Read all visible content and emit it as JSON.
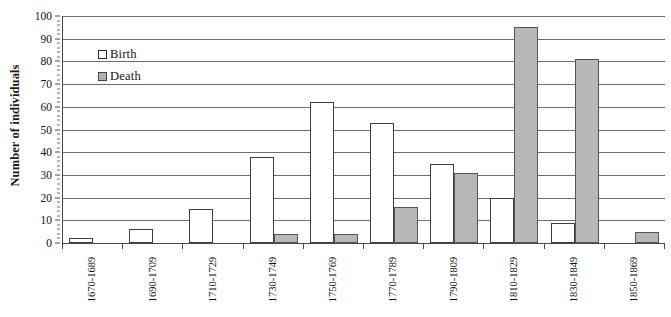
{
  "chart_data": {
    "type": "bar",
    "title": "",
    "xlabel": "",
    "ylabel": "Number of individuals",
    "ylim": [
      0,
      100
    ],
    "ytick_step": 10,
    "yticks": [
      0,
      10,
      20,
      30,
      40,
      50,
      60,
      70,
      80,
      90,
      100
    ],
    "grid": true,
    "legend_position": "inside-upper-left",
    "categories": [
      "1670-1689",
      "1690-1709",
      "1710-1729",
      "1730-1749",
      "1750-1769",
      "1770-1789",
      "1790-1809",
      "1810-1829",
      "1830-1849",
      "1850-1869"
    ],
    "series": [
      {
        "name": "Birth",
        "color": "#ffffff",
        "border_color": "#3d3d3d",
        "values": [
          2,
          6,
          15,
          38,
          62,
          53,
          35,
          20,
          9,
          0
        ]
      },
      {
        "name": "Death",
        "color": "#b8b8b8",
        "border_color": "#555555",
        "values": [
          0,
          0,
          0,
          4,
          4,
          16,
          31,
          95,
          81,
          5
        ]
      }
    ]
  },
  "legend": {
    "items": [
      {
        "label": "Birth",
        "swatch": "birth-swatch"
      },
      {
        "label": "Death",
        "swatch": "death-swatch"
      }
    ]
  },
  "axes": {
    "y_title": "Number of individuals"
  }
}
